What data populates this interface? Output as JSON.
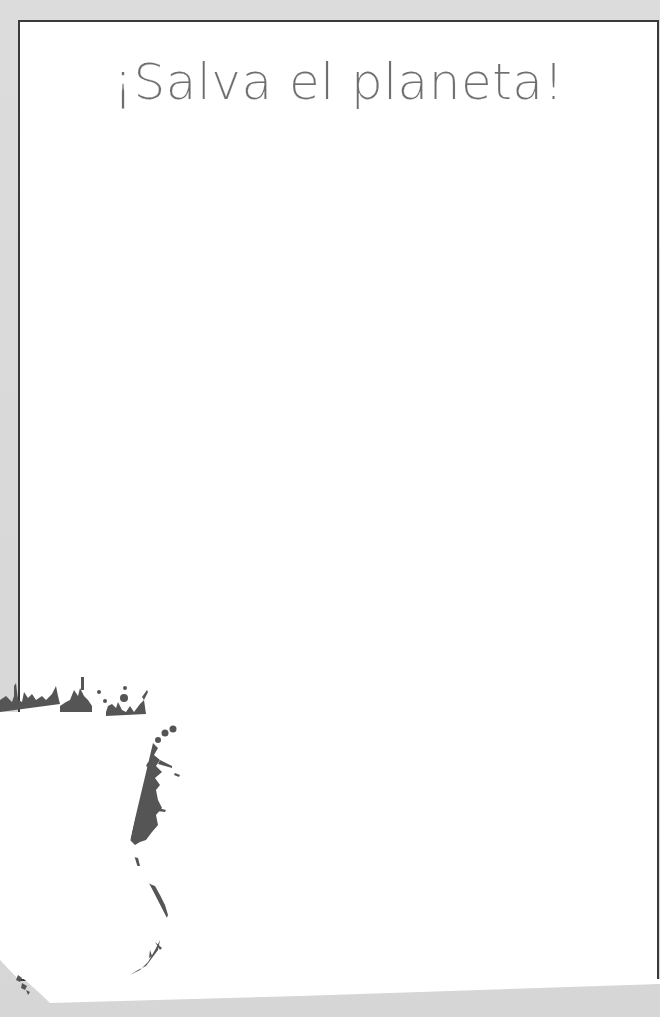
{
  "page": {
    "title": "¡Salva el planeta!",
    "colors": {
      "background": "#d9d9d9",
      "frame_border": "#3a3a3a",
      "frame_fill": "#ffffff",
      "title_text": "#6e6e6e",
      "splatter": "#5a5a5a"
    }
  },
  "decorations": {
    "corner": "torn-paper-ink-splatter"
  }
}
